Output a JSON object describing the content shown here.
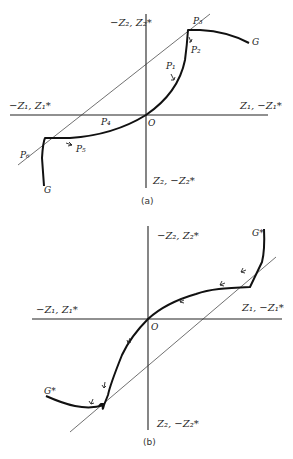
{
  "panel_a": {
    "caption": "(a)",
    "axis_top": "−Z₂, Z₂*",
    "axis_bottom": "Z₂, −Z₂*",
    "axis_left": "−Z₁, Z₁*",
    "axis_right": "Z₁, −Z₁*",
    "origin": "O",
    "curve_label_upper": "G",
    "curve_label_lower": "G",
    "points": [
      "P₁",
      "P₂",
      "P₃",
      "P₄",
      "P₅",
      "P₆"
    ]
  },
  "panel_b": {
    "caption": "(b)",
    "axis_top": "−Z₂, Z₂*",
    "axis_bottom": "Z₂, −Z₂*",
    "axis_left": "−Z₁, Z₁*",
    "axis_right": "Z₁, −Z₁*",
    "origin": "O",
    "curve_label_upper": "G*",
    "curve_label_lower": "G*"
  },
  "colors": {
    "line": "#111111",
    "background": "#ffffff"
  }
}
